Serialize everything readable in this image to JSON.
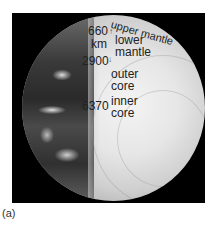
{
  "figure": {
    "caption": "(a)",
    "depths": [
      {
        "value": "660",
        "unit": "km"
      },
      {
        "value": "2900"
      },
      {
        "value": "6370"
      }
    ],
    "layers": [
      {
        "name": "upper mantle"
      },
      {
        "name_line1": "lower",
        "name_line2": "mantle"
      },
      {
        "name_line1": "outer",
        "name_line2": "core"
      },
      {
        "name_line1": "inner",
        "name_line2": "core"
      }
    ],
    "arrows": {
      "up": "↑",
      "down": "↓"
    }
  }
}
